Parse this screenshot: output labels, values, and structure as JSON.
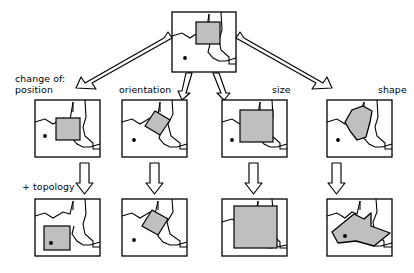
{
  "figure": {
    "title": "",
    "background_color": "#ffffff",
    "line_color": "#000000",
    "fill_color": "#bfbfbf",
    "arrow_fill": "#ffffff",
    "dot_color": "#000000"
  },
  "labels": {
    "change_of": "change of:\nposition",
    "orientation": "orientation",
    "size": "size",
    "shape": "shape",
    "topology": "+ topology"
  },
  "panels": {
    "reference": {
      "name": "reference-map",
      "object": "square",
      "dot_inside_object": false
    },
    "row_middle": [
      {
        "name": "position-map",
        "object": "square",
        "dot_inside_object": false
      },
      {
        "name": "orientation-map",
        "object": "rotated-square",
        "dot_inside_object": false
      },
      {
        "name": "size-map",
        "object": "large-square",
        "dot_inside_object": false
      },
      {
        "name": "shape-map",
        "object": "blob-polygon",
        "dot_inside_object": false
      }
    ],
    "row_bottom": [
      {
        "name": "position-topology-map",
        "object": "square",
        "dot_inside_object": true
      },
      {
        "name": "orientation-topology-map",
        "object": "rotated-square",
        "dot_inside_object": false
      },
      {
        "name": "size-topology-map",
        "object": "very-large-square",
        "dot_inside_object": false
      },
      {
        "name": "shape-topology-map",
        "object": "elongated-polygon",
        "dot_inside_object": true
      }
    ]
  },
  "arrows": {
    "diagonal": [
      {
        "name": "arrow-to-position",
        "direction": "down-left"
      },
      {
        "name": "arrow-to-orientation",
        "direction": "down"
      },
      {
        "name": "arrow-to-size",
        "direction": "down"
      },
      {
        "name": "arrow-to-shape",
        "direction": "down-right"
      }
    ],
    "vertical": [
      {
        "name": "arrow-position-topology",
        "direction": "down"
      },
      {
        "name": "arrow-orientation-topology",
        "direction": "down"
      },
      {
        "name": "arrow-size-topology",
        "direction": "down"
      },
      {
        "name": "arrow-shape-topology",
        "direction": "down"
      }
    ]
  }
}
